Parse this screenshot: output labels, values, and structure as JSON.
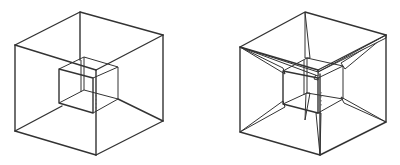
{
  "figures": [
    {
      "name": "cube-within-cube",
      "description": "Cube nested inside a larger cube, corners unconnected"
    },
    {
      "name": "tesseract-projection",
      "description": "Cube nested inside a larger cube with corresponding corners connected by tapered edges"
    }
  ],
  "colors": {
    "line": "#333333",
    "background": "#ffffff"
  }
}
